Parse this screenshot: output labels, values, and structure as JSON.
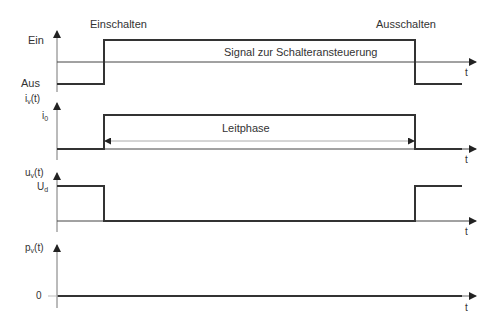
{
  "labels": {
    "einschalten": "Einschalten",
    "ausschalten": "Ausschalten",
    "signal": "Signal zur Schalteransteuerung",
    "leitphase": "Leitphase",
    "time_axis": "t"
  },
  "panels": [
    {
      "name": "control-signal",
      "ylabel": "",
      "levels": [
        "Ein",
        "Aus"
      ]
    },
    {
      "name": "current",
      "ylabel_main": "i",
      "ylabel_sub": "v",
      "ylabel_tail": "(t)",
      "level_main": "i",
      "level_sub": "0"
    },
    {
      "name": "voltage",
      "ylabel_main": "u",
      "ylabel_sub": "v",
      "ylabel_tail": "(t)",
      "level_main": "U",
      "level_sub": "d"
    },
    {
      "name": "power",
      "ylabel_main": "p",
      "ylabel_sub": "v",
      "ylabel_tail": "(t)",
      "level": "0"
    }
  ],
  "colors": {
    "signal": "#333333",
    "axis": "#555555",
    "thin": "#999999"
  }
}
